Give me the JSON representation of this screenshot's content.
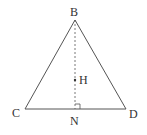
{
  "diagram": {
    "type": "geometry",
    "points": {
      "B": {
        "label": "B",
        "x": 75,
        "y": 20
      },
      "C": {
        "label": "C",
        "x": 25,
        "y": 109
      },
      "D": {
        "label": "D",
        "x": 126,
        "y": 109
      },
      "N": {
        "label": "N",
        "x": 75,
        "y": 109
      },
      "H": {
        "label": "H",
        "x": 75,
        "y": 80
      }
    },
    "segments": [
      {
        "from": "B",
        "to": "C",
        "style": "solid"
      },
      {
        "from": "B",
        "to": "D",
        "style": "solid"
      },
      {
        "from": "C",
        "to": "D",
        "style": "solid"
      },
      {
        "from": "B",
        "to": "N",
        "style": "dashed"
      }
    ],
    "right_angle_at": "N",
    "colors": {
      "line": "#555555",
      "text": "#333333"
    }
  }
}
